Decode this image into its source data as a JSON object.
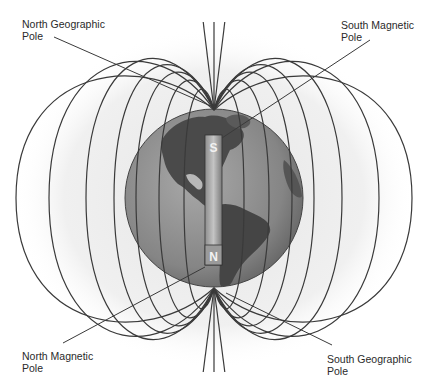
{
  "labels": {
    "north_geographic_pole": {
      "line1": "North Geographic",
      "line2": "Pole"
    },
    "south_magnetic_pole": {
      "line1": "South Magnetic",
      "line2": "Pole"
    },
    "north_magnetic_pole": {
      "line1": "North Magnetic",
      "line2": "Pole"
    },
    "south_geographic_pole": {
      "line1": "South Geographic",
      "line2": "Pole"
    }
  },
  "magnet": {
    "top_pole": "S",
    "bottom_pole": "N"
  },
  "colors": {
    "field_line": "#3a3a3a",
    "globe_ocean": "#8c8c8c",
    "globe_land": "#4a4a4a",
    "halo": "#ececec",
    "magnet_bar": "#a8a8a8",
    "text": "#2a2a2a"
  }
}
